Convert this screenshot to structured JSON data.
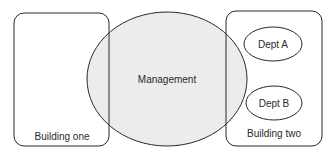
{
  "diagram": {
    "building_one": {
      "label": "Building one"
    },
    "management": {
      "label": "Management",
      "fill": "#ececec"
    },
    "building_two": {
      "label": "Building two",
      "departments": [
        {
          "label": "Dept A"
        },
        {
          "label": "Dept B"
        }
      ]
    },
    "colors": {
      "stroke": "#2a2a2a",
      "background": "#ffffff",
      "overlap_fill": "#ececec"
    }
  }
}
